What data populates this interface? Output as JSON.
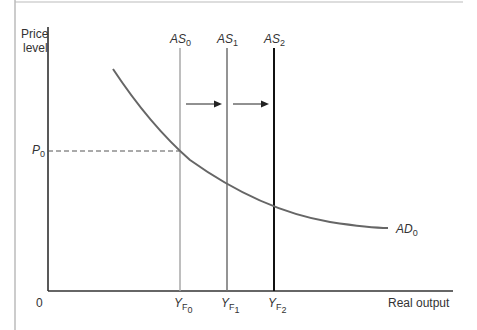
{
  "diagram": {
    "type": "AS-AD shift",
    "y_axis_label_line1": "Price",
    "y_axis_label_line2": "level",
    "x_axis_label": "Real output",
    "origin_label": "0",
    "price_label": {
      "base": "P",
      "sub": "0"
    },
    "supply_curves": [
      {
        "base": "AS",
        "sub": "0",
        "color": "#a8a8a8"
      },
      {
        "base": "AS",
        "sub": "1",
        "color": "#707070"
      },
      {
        "base": "AS",
        "sub": "2",
        "color": "#111111"
      }
    ],
    "output_labels": [
      {
        "base": "Y",
        "sub1": "F",
        "sub2": "0"
      },
      {
        "base": "Y",
        "sub1": "F",
        "sub2": "1"
      },
      {
        "base": "Y",
        "sub1": "F",
        "sub2": "2"
      }
    ],
    "demand_curve": {
      "base": "AD",
      "sub": "0",
      "color": "#666666"
    },
    "arrows": [
      "AS0 to AS1",
      "AS1 to AS2"
    ]
  }
}
